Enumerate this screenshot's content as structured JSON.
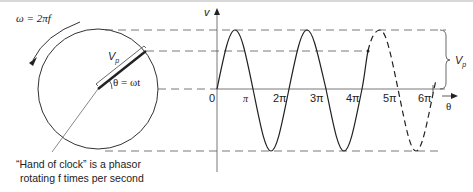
{
  "diagram": {
    "omega_label": "ω = 2πf",
    "phasor_label": "V",
    "phasor_sub": "p",
    "angle_label": "θ = ωt",
    "caption_line1": "“Hand of clock” is a phasor",
    "caption_line2": "rotating f times per second",
    "y_axis_label": "v",
    "x_axis_label": "θ",
    "tick_labels": [
      "0",
      "π",
      "2π",
      "3π",
      "4π",
      "5π",
      "6π"
    ],
    "brace_label": "V",
    "brace_sub": "p"
  },
  "colors": {
    "stroke": "#333333",
    "dash": "#555555",
    "background": "#ffffff"
  }
}
